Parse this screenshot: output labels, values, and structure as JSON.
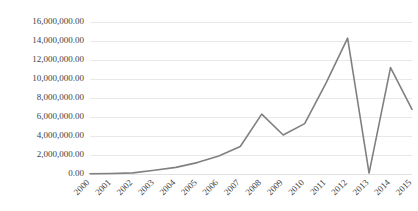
{
  "chart_data": {
    "type": "line",
    "title": "",
    "xlabel": "",
    "ylabel": "",
    "categories": [
      "2000",
      "2001",
      "2002",
      "2003",
      "2004",
      "2005",
      "2006",
      "2007",
      "2008",
      "2009",
      "2010",
      "2011",
      "2012",
      "2013",
      "2014",
      "2015"
    ],
    "values": [
      20000,
      60000,
      120000,
      400000,
      700000,
      1200000,
      1900000,
      2900000,
      6300000,
      4100000,
      5300000,
      9600000,
      14300000,
      100000,
      11200000,
      6800000
    ],
    "series": [
      {
        "name": "Series 1",
        "values": [
          20000,
          60000,
          120000,
          400000,
          700000,
          1200000,
          1900000,
          2900000,
          6300000,
          4100000,
          5300000,
          9600000,
          14300000,
          100000,
          11200000,
          6800000
        ]
      }
    ],
    "ylim": [
      0,
      16000000
    ],
    "ytick_values": [
      0,
      2000000,
      4000000,
      6000000,
      8000000,
      10000000,
      12000000,
      14000000,
      16000000
    ],
    "ytick_labels": [
      "0.00",
      "2,000,000.00",
      "4,000,000.00",
      "6,000,000.00",
      "8,000,000.00",
      "10,000,000.00",
      "12,000,000.00",
      "14,000,000.00",
      "16,000,000.00"
    ],
    "xtick_labels": [
      "2000",
      "2001",
      "2002",
      "2003",
      "2004",
      "2005",
      "2006",
      "2007",
      "2008",
      "2009",
      "2010",
      "2011",
      "2012",
      "2013",
      "2014",
      "2015"
    ],
    "xtick_rotation": -45,
    "grid": true,
    "legend": false,
    "legend_position": "none",
    "line_color": "#808080",
    "grid_color": "#e2e2e2",
    "text_color": "#3f3f3f",
    "background_color": "#ffffff"
  }
}
